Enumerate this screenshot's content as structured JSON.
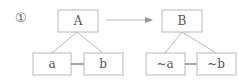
{
  "figure_number": "①",
  "left_tree": {
    "root": "A",
    "children": [
      "a",
      "b"
    ]
  },
  "right_tree": {
    "root": "B",
    "children": [
      "~a",
      "~b"
    ]
  },
  "relation": "arrow from A tree to B tree",
  "colors": {
    "box_stroke": "#b8b8b8",
    "text": "#555555",
    "arrow": "#999999"
  }
}
